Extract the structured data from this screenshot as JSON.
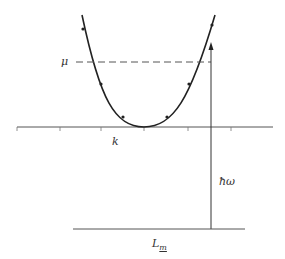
{
  "diagram": {
    "type": "dispersion-parabola",
    "labels": {
      "mu": "μ",
      "k": "k",
      "hbar_omega": "ħω",
      "L": "L",
      "L_sub": "m"
    },
    "colors": {
      "line": "#222222",
      "axis": "#555555",
      "dashed": "#555555",
      "text": "#333333"
    },
    "axis": {
      "y": 127,
      "x_start": 17,
      "x_end": 273,
      "ticks_x": [
        17,
        60,
        101,
        144,
        188,
        231
      ]
    },
    "parabola": {
      "vertex": [
        144,
        127
      ],
      "left_top": [
        82,
        15
      ],
      "right_top": [
        215,
        15
      ]
    },
    "points": [
      [
        83,
        29
      ],
      [
        101,
        84
      ],
      [
        123,
        117
      ],
      [
        167,
        117
      ],
      [
        189,
        84
      ],
      [
        212,
        25
      ]
    ],
    "mu_line": {
      "y": 62,
      "x_start": 76,
      "x_end": 211
    },
    "arrow": {
      "x": 211,
      "y_from": 229,
      "y_to": 43
    },
    "baseline": {
      "y": 229,
      "x_start": 73,
      "x_end": 245
    }
  }
}
